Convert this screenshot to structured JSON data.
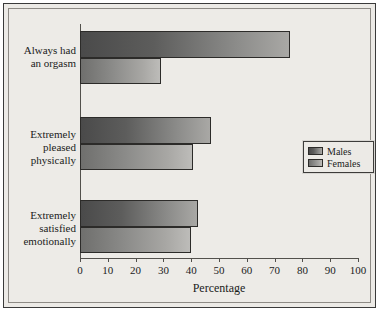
{
  "chart_data": {
    "type": "bar",
    "orientation": "horizontal",
    "title": "",
    "xlabel": "Percentage",
    "ylabel": "",
    "xlim": [
      0,
      100
    ],
    "xticks": [
      0,
      10,
      20,
      30,
      40,
      50,
      60,
      70,
      80,
      90,
      100
    ],
    "xtick_labels": [
      "0",
      "10",
      "20",
      "30",
      "40",
      "50",
      "60",
      "70",
      "80",
      "90",
      "100"
    ],
    "grid": false,
    "legend_position": "right",
    "categories": [
      "Always had\nan orgasm",
      "Extremely\npleased\nphysically",
      "Extremely\nsatisfied\nemotionally"
    ],
    "series": [
      {
        "name": "Males",
        "values": [
          75.5,
          47,
          42.5
        ],
        "color": "#5d5d5c"
      },
      {
        "name": "Females",
        "values": [
          29,
          40.5,
          40
        ],
        "color": "#a8a7a4"
      }
    ]
  },
  "legend": {
    "entries": [
      {
        "label": "Males"
      },
      {
        "label": "Females"
      }
    ]
  },
  "axis": {
    "x_title": "Percentage"
  },
  "colors": {
    "figure_background": "#edebe7",
    "frame_border": "#3a3a3a",
    "axis_line": "#52504c",
    "text": "#1b1b1b",
    "males_dark": "#4a4a4a",
    "males_light": "#a9a8a5",
    "females_dark": "#6f6f6d",
    "females_light": "#bdbcb9"
  }
}
